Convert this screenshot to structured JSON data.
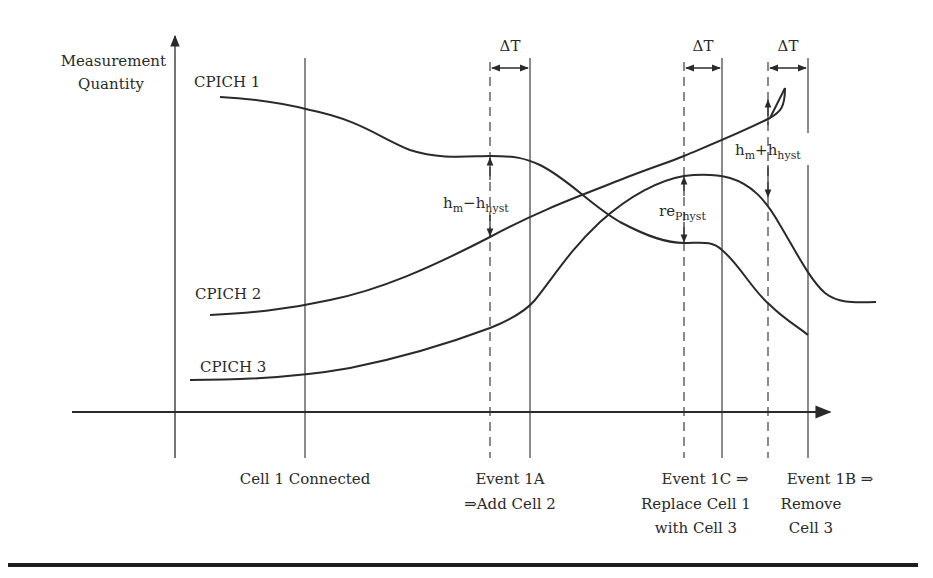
{
  "axes": {
    "y_label_line1": "Measurement",
    "y_label_line2": "Quantity"
  },
  "curves": [
    {
      "name": "CPICH 1",
      "label": "CPICH 1"
    },
    {
      "name": "CPICH 2",
      "label": "CPICH 2"
    },
    {
      "name": "CPICH 3",
      "label": "CPICH 3"
    }
  ],
  "delta_t": {
    "label": "ΔT"
  },
  "annotations": {
    "hm_minus_hyst": {
      "main1": "h",
      "sub1": "m",
      "op": "−",
      "main2": "h",
      "sub2": "hyst"
    },
    "re_physt": {
      "main": "re",
      "sub": "Physt"
    },
    "hm_plus_hyst": {
      "main1": "h",
      "sub1": "m",
      "op": "+",
      "main2": "h",
      "sub2": "hyst"
    }
  },
  "events": [
    {
      "id": "connected",
      "lines": [
        "Cell 1 Connected"
      ]
    },
    {
      "id": "1A",
      "lines": [
        "Event 1A",
        "⇒Add Cell 2"
      ]
    },
    {
      "id": "1C",
      "lines": [
        "Event 1C ⇒",
        "Replace Cell 1",
        "with Cell 3"
      ]
    },
    {
      "id": "1B",
      "lines": [
        "Event 1B ⇒",
        "Remove",
        "Cell 3"
      ]
    }
  ],
  "colors": {
    "ink": "#2a2a2a",
    "background": "#ffffff"
  }
}
